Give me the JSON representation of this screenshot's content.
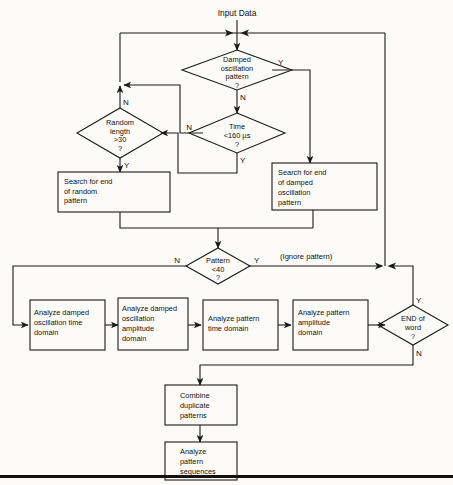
{
  "figure": {
    "type": "flowchart",
    "title": "Input Data",
    "orientation": "top-down",
    "line_color": "#1b1b1b",
    "background": "#fcfbf8"
  },
  "labels": {
    "input_data": "Input Data",
    "ignore_pattern": "(Ignore pattern)",
    "yes": "Y",
    "no": "N"
  },
  "decisions": [
    {
      "id": "damped-oscillation-pattern",
      "lines": [
        "Damped",
        "oscillation",
        "pattern",
        "?"
      ],
      "yes_label": "Y",
      "no_label": "N"
    },
    {
      "id": "random-length",
      "lines": [
        "Random",
        "length",
        ">30",
        "?"
      ],
      "yes_label": "Y",
      "no_label": "N"
    },
    {
      "id": "time-threshold",
      "lines": [
        "Time",
        "<160 µs",
        "?"
      ],
      "yes_label": "Y",
      "no_label": "N"
    },
    {
      "id": "pattern-count",
      "lines": [
        "Pattern",
        "<40",
        "?"
      ],
      "yes_label": "Y",
      "no_label": "N"
    },
    {
      "id": "end-of-word",
      "lines": [
        "END of",
        "word",
        "?"
      ],
      "yes_label": "Y",
      "no_label": "N"
    }
  ],
  "processes": [
    {
      "id": "search-end-random-pattern",
      "lines": [
        "Search for end",
        "of random",
        "pattern"
      ]
    },
    {
      "id": "search-end-damped-oscillation-pattern",
      "lines": [
        "Search for end",
        "of damped",
        "oscillation",
        "pattern"
      ]
    },
    {
      "id": "analyze-damped-oscillation-time-domain",
      "lines": [
        "Analyze damped",
        "oscillation time",
        "domain"
      ]
    },
    {
      "id": "analyze-damped-oscillation-amplitude-domain",
      "lines": [
        "Analyze damped",
        "oscillation",
        "amplitude",
        "domain"
      ]
    },
    {
      "id": "analyze-pattern-time-domain",
      "lines": [
        "Analyze pattern",
        "time domain"
      ]
    },
    {
      "id": "analyze-pattern-amplitude-domain",
      "lines": [
        "Analyze pattern",
        "amplitude",
        "domain"
      ]
    },
    {
      "id": "combine-duplicate-patterns",
      "lines": [
        "Combine",
        "duplicate",
        "patterns"
      ]
    },
    {
      "id": "analyze-pattern-sequences",
      "lines": [
        "Analyze",
        "pattern",
        "sequences"
      ]
    }
  ],
  "flags": {
    "damped_yes": "Y",
    "damped_no": "N",
    "random_no": "N",
    "random_yes": "Y",
    "time_no": "N",
    "time_yes": "Y",
    "pattern_no": "N",
    "pattern_yes": "Y",
    "endword_yes": "Y",
    "endword_no": "N"
  }
}
